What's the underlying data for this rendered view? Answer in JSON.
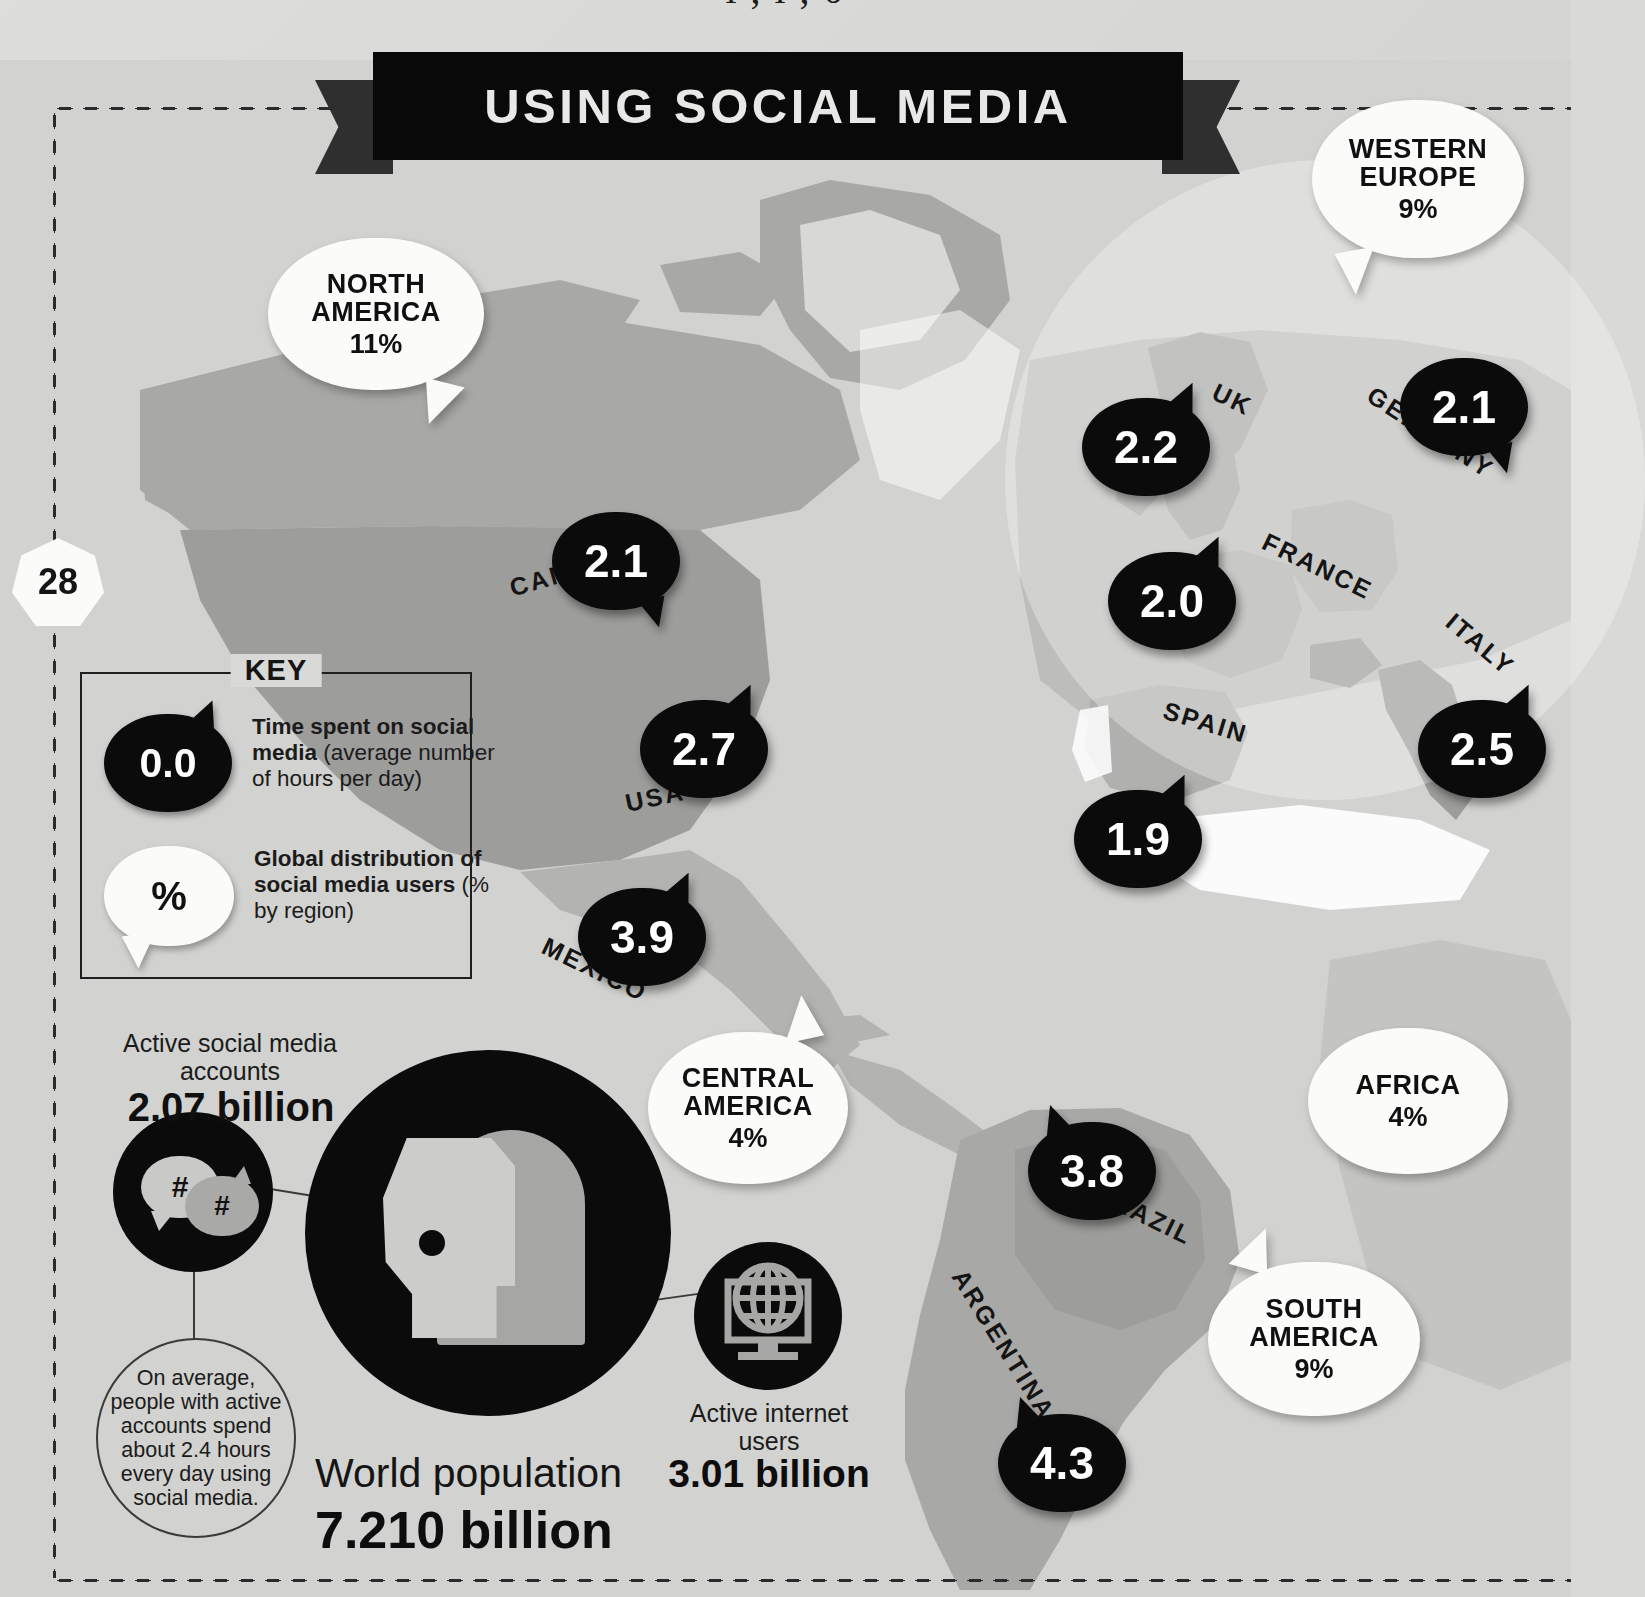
{
  "page": {
    "number": "28",
    "top_cut_text": "l   ,     l  ,    0"
  },
  "header": {
    "banner_title": "USING SOCIAL MEDIA"
  },
  "key": {
    "title": "KEY",
    "items": [
      {
        "icon": "0.0",
        "style": "black-bubble",
        "bold_text": "Time spent on social media",
        "regular_text": "(average number of hours per day)"
      },
      {
        "icon": "%",
        "style": "white-bubble",
        "bold_text": "Global distribution of social media users",
        "regular_text": " (% by region)"
      }
    ]
  },
  "stats": {
    "accounts_label": "Active social media accounts",
    "accounts_value": "2.07 billion",
    "hash_icon_1": "#",
    "hash_icon_2": "#",
    "note": "On average, people with active accounts spend about 2.4 hours every day using social media.",
    "world_population_label": "World population",
    "world_population_value": "7.210 billion",
    "internet_label": "Active internet users",
    "internet_value": "3.01 billion"
  },
  "chart_data": {
    "type": "map",
    "title": "USING SOCIAL MEDIA",
    "unit_hours": "average number of hours per day on social media",
    "unit_pct": "% of global social media users by region",
    "countries": [
      {
        "name": "CANADA",
        "hours": 2.1,
        "label": "2.1",
        "x": 552,
        "y": 512,
        "lx": 508,
        "ly": 557,
        "rot": -16,
        "tail": "t-br"
      },
      {
        "name": "USA",
        "hours": 2.7,
        "label": "2.7",
        "x": 640,
        "y": 700,
        "lx": 625,
        "ly": 783,
        "rot": -12,
        "tail": "t-tr"
      },
      {
        "name": "MEXICO",
        "hours": 3.9,
        "label": "3.9",
        "x": 578,
        "y": 888,
        "lx": 538,
        "ly": 955,
        "rot": 26,
        "tail": "t-tr"
      },
      {
        "name": "UK",
        "hours": 2.2,
        "label": "2.2",
        "x": 1082,
        "y": 398,
        "lx": 1212,
        "ly": 385,
        "rot": 26,
        "tail": "t-tr"
      },
      {
        "name": "GERMANY",
        "hours": 2.1,
        "label": "2.1",
        "x": 1400,
        "y": 358,
        "lx": 1358,
        "ly": 418,
        "rot": 33,
        "tail": "t-br"
      },
      {
        "name": "FRANCE",
        "hours": 2.0,
        "label": "2.0",
        "x": 1108,
        "y": 552,
        "lx": 1258,
        "ly": 552,
        "rot": 26,
        "tail": "t-tr"
      },
      {
        "name": "SPAIN",
        "hours": 1.9,
        "label": "1.9",
        "x": 1074,
        "y": 790,
        "lx": 1162,
        "ly": 708,
        "rot": 17,
        "tail": "t-tr"
      },
      {
        "name": "ITALY",
        "hours": 2.5,
        "label": "2.5",
        "x": 1418,
        "y": 700,
        "lx": 1440,
        "ly": 630,
        "rot": 40,
        "tail": "t-tr"
      },
      {
        "name": "BRAZIL",
        "hours": 3.8,
        "label": "3.8",
        "x": 1028,
        "y": 1122,
        "lx": 1090,
        "ly": 1200,
        "rot": 26,
        "tail": "t-tl"
      },
      {
        "name": "ARGENTINA",
        "hours": 4.3,
        "label": "4.3",
        "x": 998,
        "y": 1414,
        "lx": 918,
        "ly": 1330,
        "rot": 58,
        "tail": "t-tl"
      }
    ],
    "regions": [
      {
        "name": "NORTH AMERICA",
        "pct": 11,
        "label": "11%",
        "lines": [
          "NORTH",
          "AMERICA"
        ],
        "x": 268,
        "y": 238,
        "w": 216,
        "h": 152,
        "tail": "t-br"
      },
      {
        "name": "WESTERN EUROPE",
        "pct": 9,
        "label": "9%",
        "lines": [
          "WESTERN",
          "EUROPE"
        ],
        "x": 1312,
        "y": 100,
        "w": 212,
        "h": 158,
        "tail": "t-bl"
      },
      {
        "name": "CENTRAL AMERICA",
        "pct": 4,
        "label": "4%",
        "lines": [
          "CENTRAL",
          "AMERICA"
        ],
        "x": 648,
        "y": 1032,
        "w": 200,
        "h": 152,
        "tail": "t-tr"
      },
      {
        "name": "AFRICA",
        "pct": 4,
        "label": "4%",
        "lines": [
          "AFRICA"
        ],
        "x": 1308,
        "y": 1028,
        "w": 200,
        "h": 146,
        "tail": "no-tail"
      },
      {
        "name": "SOUTH AMERICA",
        "pct": 9,
        "label": "9%",
        "lines": [
          "SOUTH",
          "AMERICA"
        ],
        "x": 1208,
        "y": 1262,
        "w": 212,
        "h": 154,
        "tail": "t-tl"
      }
    ]
  },
  "colors": {
    "background": "#d9d9d7",
    "ink": "#0b0b0b",
    "bubble_white": "#fbfbfa",
    "land": "#a8a8a6",
    "land_light": "#c4c4c2",
    "ocean": "#d2d2d0"
  }
}
